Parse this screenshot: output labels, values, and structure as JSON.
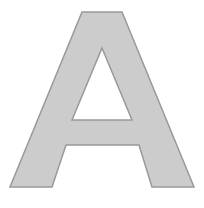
{
  "image": {
    "kind": "letter-glyph",
    "character": "A",
    "description": "Uppercase letter A outline glyph",
    "width": 204,
    "height": 208,
    "background_color": "#ffffff"
  },
  "glyph": {
    "character": "A",
    "fill_color": "#cccccc",
    "stroke_color": "#999999",
    "stroke_width": 1.5,
    "counter_color": "#ffffff",
    "outer_path": "M 82,12 L 122,12 L 194,187 L 152,187 L 139,145 L 66,145 L 52,187 L 10,187 Z",
    "counter_path": "M 102,48 L 132,120 L 72,120 Z",
    "outer_points": [
      [
        82,
        12
      ],
      [
        122,
        12
      ],
      [
        194,
        187
      ],
      [
        152,
        187
      ],
      [
        139,
        145
      ],
      [
        66,
        145
      ],
      [
        52,
        187
      ],
      [
        10,
        187
      ]
    ],
    "counter_points": [
      [
        102,
        48
      ],
      [
        132,
        120
      ],
      [
        72,
        120
      ]
    ]
  }
}
